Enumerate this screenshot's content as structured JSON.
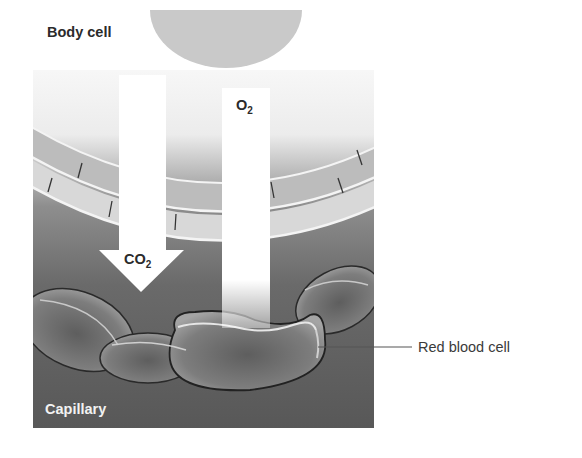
{
  "diagram": {
    "type": "gas exchange between body cell and capillary",
    "labels": {
      "body_cell": "Body cell",
      "capillary": "Capillary",
      "red_blood_cell": "Red blood cell"
    },
    "arrows": [
      {
        "id": "o2",
        "base": "O",
        "subscript": "2",
        "direction": "down",
        "from": "Body cell side",
        "to": "Red blood cell"
      },
      {
        "id": "co2",
        "base": "CO",
        "subscript": "2",
        "direction": "down",
        "note": "arrow into capillary"
      }
    ],
    "colors": {
      "body_cell_fill": "#c9c9c9",
      "capillary_dark": "#5a5a5a",
      "capillary_mid": "#8a8a8a",
      "wall_band": "#bdbdbd",
      "wall_band_light": "#d9d9d9",
      "rbc_fill": "#7a7a7a",
      "arrow_fill": "#ffffff"
    }
  }
}
